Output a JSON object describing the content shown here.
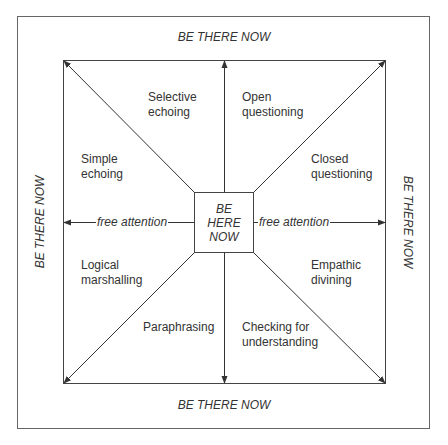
{
  "diagram": {
    "outer_labels": {
      "top": "BE THERE NOW",
      "bottom": "BE THERE NOW",
      "left": "BE THERE NOW",
      "right": "BE THERE NOW"
    },
    "center": [
      "BE",
      "HERE",
      "NOW"
    ],
    "arrow_labels": {
      "left": "free attention",
      "right": "free attention"
    },
    "segments": [
      {
        "id": "selective-echoing",
        "lines": [
          "Selective",
          "echoing"
        ]
      },
      {
        "id": "open-questioning",
        "lines": [
          "Open",
          "questioning"
        ]
      },
      {
        "id": "simple-echoing",
        "lines": [
          "Simple",
          "echoing"
        ]
      },
      {
        "id": "closed-questioning",
        "lines": [
          "Closed",
          "questioning"
        ]
      },
      {
        "id": "logical-marshalling",
        "lines": [
          "Logical",
          "marshalling"
        ]
      },
      {
        "id": "empathic-divining",
        "lines": [
          "Empathic",
          "divining"
        ]
      },
      {
        "id": "paraphrasing",
        "lines": [
          "Paraphrasing"
        ]
      },
      {
        "id": "checking-for-understanding",
        "lines": [
          "Checking for",
          "understanding"
        ]
      }
    ],
    "colors": {
      "line": "#3a3a3a",
      "frame": "#555555",
      "background": "#ffffff"
    }
  }
}
